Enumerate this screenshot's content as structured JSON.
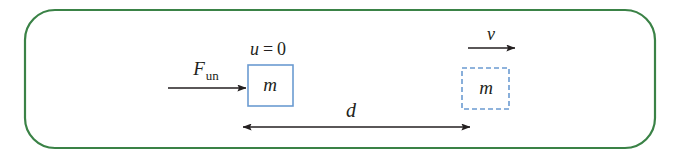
{
  "figure": {
    "frame": {
      "border_color": "#3a8246",
      "border_width": 2.2,
      "corner_radius": 30,
      "x": 25,
      "y": 10,
      "width": 630,
      "height": 138,
      "fill": "#ffffff"
    },
    "ink_color": "#231f20",
    "box_color": "#6b9bd1",
    "labels": {
      "force": {
        "base": "F",
        "subscript": "un",
        "x": 206,
        "y": 75,
        "font_size": 19
      },
      "initial_velocity": {
        "text": "u = 0",
        "variable": "u",
        "value": "0",
        "x": 268,
        "y": 55,
        "font_size": 18
      },
      "mass_start": {
        "text": "m",
        "x": 270,
        "y": 91,
        "font_size": 19
      },
      "mass_end": {
        "text": "m",
        "x": 485,
        "y": 94,
        "font_size": 19
      },
      "final_velocity": {
        "text": "v",
        "x": 491,
        "y": 40,
        "font_size": 18
      },
      "distance": {
        "text": "d",
        "x": 351,
        "y": 117,
        "font_size": 20
      }
    },
    "shapes": {
      "solid_box": {
        "name": "mass-box-initial",
        "x": 248,
        "y": 65,
        "width": 45,
        "height": 41,
        "stroke": "#6b9bd1",
        "stroke_width": 1.6,
        "dashed": false
      },
      "dashed_box": {
        "name": "mass-box-final",
        "x": 462,
        "y": 68,
        "width": 47,
        "height": 41,
        "stroke": "#6b9bd1",
        "stroke_width": 1.6,
        "dashed": true,
        "dash_pattern": "5,3"
      }
    },
    "arrows": {
      "force_arrow": {
        "name": "force-arrow",
        "x1": 168,
        "y1": 88,
        "x2": 248,
        "y2": 88,
        "heads": "end",
        "stroke_width": 1.4
      },
      "velocity_arrow": {
        "name": "velocity-arrow",
        "x1": 468,
        "y1": 48,
        "x2": 517,
        "y2": 48,
        "heads": "end",
        "stroke_width": 1.4
      },
      "distance_arrow": {
        "name": "distance-arrow",
        "x1": 241,
        "y1": 127,
        "x2": 472,
        "y2": 127,
        "heads": "both",
        "stroke_width": 1.5
      }
    }
  }
}
